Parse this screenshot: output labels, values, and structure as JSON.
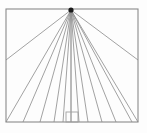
{
  "figure": {
    "background_color": "#fdfdfd",
    "line_color": "#8a8a8a",
    "frame_color": "#8a8a8a",
    "vanishing_point_color": "#1a1a1a",
    "canvas": {
      "width": 147,
      "height": 133
    },
    "frame": {
      "name": "picture-frame",
      "x": 6,
      "y": 9,
      "width": 132,
      "height": 113,
      "stroke_width": 1.1
    },
    "vanishing_point": {
      "name": "vanishing-point",
      "x": 71,
      "y": 10,
      "dot_radius": 2.6,
      "label": "VP"
    },
    "rays": {
      "name": "perspective-rays",
      "stroke_width": 0.8,
      "count": 13,
      "endpoints_bottom_x": [
        6,
        23,
        40,
        54,
        63,
        71,
        79,
        88,
        102,
        116,
        132,
        138
      ],
      "endpoints_side": [
        {
          "x": 6,
          "y": 60
        },
        {
          "x": 138,
          "y": 60
        }
      ],
      "bottom_y": 122
    },
    "ground_square": {
      "name": "ground-plane-square",
      "x": 66,
      "y": 112,
      "width": 12,
      "height": 10,
      "stroke_width": 0.9
    },
    "center_line": {
      "name": "center-vertical-line",
      "x": 71,
      "y_top": 10,
      "y_bottom": 122
    }
  }
}
